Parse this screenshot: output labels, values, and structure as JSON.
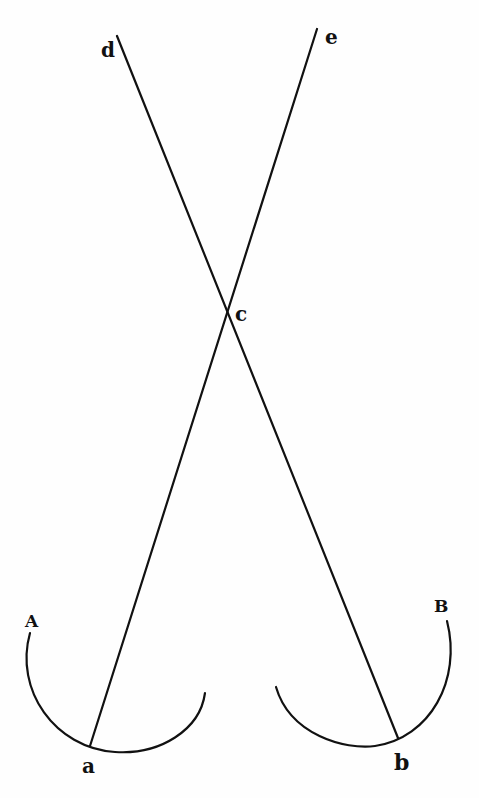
{
  "diagram": {
    "labels": {
      "d": "d",
      "e": "e",
      "c": "c",
      "A": "A",
      "B": "B",
      "a": "a",
      "b": "b"
    },
    "lines": [
      {
        "name": "line-d-b",
        "from": "d",
        "through": "c",
        "to": "b"
      },
      {
        "name": "line-e-a",
        "from": "e",
        "through": "c",
        "to": "a"
      }
    ],
    "arcs": [
      {
        "name": "arc-A",
        "label": "A",
        "passes_through": "a"
      },
      {
        "name": "arc-B",
        "label": "B",
        "passes_through": "b"
      }
    ],
    "colors": {
      "ink": "#111111",
      "paper": "#fefefe"
    }
  }
}
